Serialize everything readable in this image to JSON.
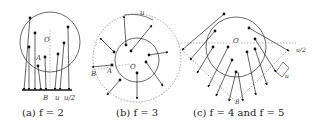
{
  "figure": {
    "panels": [
      {
        "id": "a",
        "caption": "(a) f = 2",
        "labels": {
          "center": "O",
          "point_a": "A",
          "point_b": "B",
          "spacing": "u",
          "half_spacing": "u/2"
        }
      },
      {
        "id": "b",
        "caption": "(b) f = 3",
        "labels": {
          "center": "O",
          "point_a": "A",
          "point_b": "B",
          "spacing": "u"
        }
      },
      {
        "id": "c",
        "caption": "(c) f = 4 and f = 5",
        "labels": {
          "center": "O",
          "point_b": "B",
          "spacing": "u",
          "half_spacing": "u/2"
        }
      }
    ]
  }
}
